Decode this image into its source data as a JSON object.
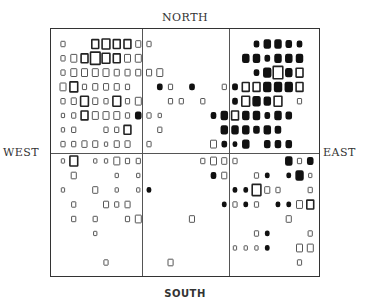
{
  "chart_data": {
    "type": "heatmap",
    "title": "",
    "labels": {
      "top": "NORTH",
      "bottom": "SOUTH",
      "left": "WEST",
      "right": "EAST"
    },
    "grid": {
      "cols": 24,
      "rows": 16,
      "col_dividers": [
        8,
        16
      ],
      "row_dividers": [
        8
      ]
    },
    "encoding": "square size = magnitude; open = one category, filled = other",
    "cells": [
      [
        0,
        0,
        3,
        "o"
      ],
      [
        3,
        0,
        6,
        "o"
      ],
      [
        4,
        0,
        7,
        "o"
      ],
      [
        5,
        0,
        6,
        "o"
      ],
      [
        6,
        0,
        6,
        "o"
      ],
      [
        7,
        0,
        4,
        "o"
      ],
      [
        8,
        0,
        3,
        "o"
      ],
      [
        18,
        0,
        3,
        "f"
      ],
      [
        19,
        0,
        5,
        "f"
      ],
      [
        20,
        0,
        5,
        "f"
      ],
      [
        21,
        0,
        4,
        "f"
      ],
      [
        22,
        0,
        3,
        "f"
      ],
      [
        0,
        1,
        3,
        "o"
      ],
      [
        1,
        1,
        5,
        "o"
      ],
      [
        2,
        1,
        6,
        "o"
      ],
      [
        3,
        1,
        9,
        "o"
      ],
      [
        4,
        1,
        7,
        "o"
      ],
      [
        5,
        1,
        6,
        "o"
      ],
      [
        6,
        1,
        5,
        "o"
      ],
      [
        7,
        1,
        5,
        "o"
      ],
      [
        17,
        1,
        5,
        "f"
      ],
      [
        18,
        1,
        5,
        "f"
      ],
      [
        19,
        1,
        3,
        "f"
      ],
      [
        20,
        1,
        5,
        "f"
      ],
      [
        21,
        1,
        5,
        "f"
      ],
      [
        22,
        1,
        5,
        "f"
      ],
      [
        0,
        2,
        3,
        "o"
      ],
      [
        1,
        2,
        5,
        "o"
      ],
      [
        2,
        2,
        5,
        "o"
      ],
      [
        3,
        2,
        5,
        "o"
      ],
      [
        4,
        2,
        5,
        "o"
      ],
      [
        5,
        2,
        4,
        "o"
      ],
      [
        6,
        2,
        4,
        "o"
      ],
      [
        7,
        2,
        4,
        "o"
      ],
      [
        8,
        2,
        4,
        "o"
      ],
      [
        9,
        2,
        5,
        "o"
      ],
      [
        18,
        2,
        3,
        "f"
      ],
      [
        19,
        2,
        6,
        "f"
      ],
      [
        20,
        2,
        9,
        "o"
      ],
      [
        21,
        2,
        5,
        "f"
      ],
      [
        22,
        2,
        6,
        "o"
      ],
      [
        0,
        3,
        5,
        "o"
      ],
      [
        1,
        3,
        7,
        "o"
      ],
      [
        2,
        3,
        3,
        "o"
      ],
      [
        3,
        3,
        4,
        "o"
      ],
      [
        4,
        3,
        4,
        "o"
      ],
      [
        5,
        3,
        4,
        "o"
      ],
      [
        6,
        3,
        3,
        "o"
      ],
      [
        9,
        3,
        3,
        "f"
      ],
      [
        10,
        3,
        3,
        "o"
      ],
      [
        12,
        3,
        3,
        "f"
      ],
      [
        15,
        3,
        3,
        "o"
      ],
      [
        16,
        3,
        3,
        "o"
      ],
      [
        16,
        3,
        3,
        "f"
      ],
      [
        17,
        3,
        6,
        "o"
      ],
      [
        18,
        3,
        6,
        "o"
      ],
      [
        19,
        3,
        6,
        "f"
      ],
      [
        20,
        3,
        6,
        "f"
      ],
      [
        21,
        3,
        6,
        "f"
      ],
      [
        22,
        3,
        6,
        "o"
      ],
      [
        0,
        4,
        3,
        "o"
      ],
      [
        1,
        4,
        4,
        "o"
      ],
      [
        2,
        4,
        7,
        "o"
      ],
      [
        3,
        4,
        4,
        "o"
      ],
      [
        4,
        4,
        3,
        "o"
      ],
      [
        5,
        4,
        7,
        "o"
      ],
      [
        6,
        4,
        3,
        "o"
      ],
      [
        7,
        4,
        5,
        "o"
      ],
      [
        10,
        4,
        3,
        "o"
      ],
      [
        11,
        4,
        3,
        "o"
      ],
      [
        13,
        4,
        3,
        "o"
      ],
      [
        16,
        4,
        3,
        "f"
      ],
      [
        17,
        4,
        7,
        "o"
      ],
      [
        18,
        4,
        6,
        "f"
      ],
      [
        19,
        4,
        5,
        "f"
      ],
      [
        20,
        4,
        7,
        "o"
      ],
      [
        22,
        4,
        3,
        "o"
      ],
      [
        0,
        5,
        2,
        "o"
      ],
      [
        1,
        5,
        3,
        "o"
      ],
      [
        2,
        5,
        6,
        "o"
      ],
      [
        3,
        5,
        5,
        "o"
      ],
      [
        4,
        5,
        5,
        "o"
      ],
      [
        5,
        5,
        5,
        "o"
      ],
      [
        6,
        5,
        3,
        "o"
      ],
      [
        7,
        5,
        4,
        "f"
      ],
      [
        8,
        5,
        3,
        "o"
      ],
      [
        9,
        5,
        2,
        "o"
      ],
      [
        14,
        5,
        3,
        "f"
      ],
      [
        15,
        5,
        5,
        "f"
      ],
      [
        16,
        5,
        6,
        "o"
      ],
      [
        17,
        5,
        5,
        "f"
      ],
      [
        18,
        5,
        5,
        "f"
      ],
      [
        19,
        5,
        3,
        "f"
      ],
      [
        20,
        5,
        5,
        "f"
      ],
      [
        21,
        5,
        4,
        "f"
      ],
      [
        0,
        6,
        2,
        "o"
      ],
      [
        1,
        6,
        3,
        "o"
      ],
      [
        4,
        6,
        3,
        "o"
      ],
      [
        5,
        6,
        3,
        "o"
      ],
      [
        6,
        6,
        6,
        "o"
      ],
      [
        9,
        6,
        3,
        "o"
      ],
      [
        15,
        6,
        5,
        "f"
      ],
      [
        16,
        6,
        5,
        "f"
      ],
      [
        17,
        6,
        5,
        "f"
      ],
      [
        18,
        6,
        4,
        "f"
      ],
      [
        19,
        6,
        5,
        "f"
      ],
      [
        20,
        6,
        4,
        "f"
      ],
      [
        0,
        7,
        3,
        "o"
      ],
      [
        1,
        7,
        3,
        "o"
      ],
      [
        2,
        7,
        4,
        "o"
      ],
      [
        3,
        7,
        4,
        "o"
      ],
      [
        4,
        7,
        2,
        "o"
      ],
      [
        5,
        7,
        4,
        "o"
      ],
      [
        6,
        7,
        4,
        "o"
      ],
      [
        8,
        7,
        3,
        "o"
      ],
      [
        14,
        7,
        5,
        "o"
      ],
      [
        15,
        7,
        3,
        "f"
      ],
      [
        16,
        7,
        2,
        "f"
      ],
      [
        17,
        7,
        5,
        "f"
      ],
      [
        19,
        7,
        4,
        "f"
      ],
      [
        20,
        7,
        4,
        "f"
      ],
      [
        21,
        7,
        4,
        "f"
      ],
      [
        0,
        8,
        2,
        "o"
      ],
      [
        1,
        8,
        7,
        "o"
      ],
      [
        3,
        8,
        2,
        "o"
      ],
      [
        4,
        8,
        2,
        "o"
      ],
      [
        5,
        8,
        5,
        "o"
      ],
      [
        6,
        8,
        3,
        "o"
      ],
      [
        7,
        8,
        3,
        "o"
      ],
      [
        13,
        8,
        3,
        "o"
      ],
      [
        14,
        8,
        5,
        "o"
      ],
      [
        15,
        8,
        4,
        "o"
      ],
      [
        16,
        8,
        3,
        "o"
      ],
      [
        21,
        8,
        5,
        "f"
      ],
      [
        22,
        8,
        3,
        "o"
      ],
      [
        23,
        8,
        4,
        "f"
      ],
      [
        1,
        9,
        4,
        "o"
      ],
      [
        5,
        9,
        2,
        "o"
      ],
      [
        7,
        9,
        2,
        "o"
      ],
      [
        14,
        9,
        3,
        "f"
      ],
      [
        15,
        9,
        4,
        "o"
      ],
      [
        18,
        9,
        3,
        "o"
      ],
      [
        19,
        9,
        2,
        "f"
      ],
      [
        21,
        9,
        2,
        "f"
      ],
      [
        22,
        9,
        6,
        "f"
      ],
      [
        23,
        9,
        2,
        "o"
      ],
      [
        0,
        10,
        2,
        "o"
      ],
      [
        3,
        10,
        4,
        "o"
      ],
      [
        5,
        10,
        2,
        "o"
      ],
      [
        7,
        10,
        2,
        "o"
      ],
      [
        8,
        10,
        2,
        "f"
      ],
      [
        16,
        10,
        2,
        "f"
      ],
      [
        17,
        10,
        2,
        "f"
      ],
      [
        18,
        10,
        8,
        "o"
      ],
      [
        19,
        10,
        4,
        "o"
      ],
      [
        20,
        10,
        3,
        "o"
      ],
      [
        23,
        10,
        3,
        "o"
      ],
      [
        1,
        11,
        3,
        "o"
      ],
      [
        4,
        11,
        4,
        "o"
      ],
      [
        5,
        11,
        3,
        "o"
      ],
      [
        6,
        11,
        4,
        "o"
      ],
      [
        15,
        11,
        2,
        "f"
      ],
      [
        16,
        11,
        3,
        "o"
      ],
      [
        17,
        11,
        2,
        "f"
      ],
      [
        18,
        11,
        3,
        "o"
      ],
      [
        20,
        11,
        2,
        "f"
      ],
      [
        21,
        11,
        2,
        "f"
      ],
      [
        22,
        11,
        5,
        "o"
      ],
      [
        23,
        11,
        6,
        "o"
      ],
      [
        1,
        12,
        3,
        "o"
      ],
      [
        3,
        12,
        3,
        "o"
      ],
      [
        6,
        12,
        3,
        "o"
      ],
      [
        7,
        12,
        5,
        "o"
      ],
      [
        12,
        12,
        4,
        "o"
      ],
      [
        21,
        12,
        4,
        "o"
      ],
      [
        3,
        13,
        2,
        "o"
      ],
      [
        18,
        13,
        3,
        "o"
      ],
      [
        19,
        13,
        2,
        "f"
      ],
      [
        23,
        13,
        3,
        "o"
      ],
      [
        16,
        14,
        2,
        "o"
      ],
      [
        17,
        14,
        2,
        "o"
      ],
      [
        18,
        14,
        2,
        "o"
      ],
      [
        19,
        14,
        2,
        "f"
      ],
      [
        22,
        14,
        5,
        "o"
      ],
      [
        23,
        14,
        5,
        "o"
      ],
      [
        4,
        15,
        3,
        "o"
      ],
      [
        10,
        15,
        4,
        "o"
      ],
      [
        22,
        15,
        3,
        "o"
      ]
    ]
  }
}
